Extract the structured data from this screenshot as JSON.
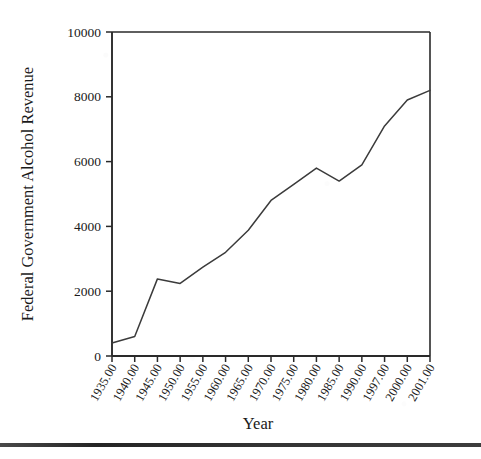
{
  "figure": {
    "background_color": "#ffffff",
    "line_color": "#3b3b3b",
    "axis_color": "#2a2a2a",
    "footer_rule": true
  },
  "chart_data": {
    "type": "line",
    "title": "",
    "xlabel": "Year",
    "ylabel": "Federal Government Alcohol Revenue",
    "xlim": [
      1935,
      2001
    ],
    "ylim": [
      0,
      10000
    ],
    "grid": false,
    "legend": "none",
    "y_ticks": [
      0,
      2000,
      4000,
      6000,
      8000,
      10000
    ],
    "y_tick_labels": [
      "0",
      "2000",
      "4000",
      "6000",
      "8000",
      "10000"
    ],
    "x_tick_labels": [
      "1935.00",
      "1940.00",
      "1945.00",
      "1950.00",
      "1955.00",
      "1960.00",
      "1965.00",
      "1970.00",
      "1975.00",
      "1980.00",
      "1985.00",
      "1990.00",
      "1997.00",
      "2000.00",
      "2001.00"
    ],
    "x": [
      1935,
      1940,
      1945,
      1950,
      1955,
      1960,
      1965,
      1970,
      1975,
      1980,
      1985,
      1990,
      1997,
      2000,
      2001
    ],
    "values": [
      400,
      600,
      2380,
      2240,
      2740,
      3200,
      3880,
      4800,
      5300,
      5800,
      5400,
      5900,
      7100,
      7900,
      8200
    ],
    "series_name": "Federal Government Alcohol Revenue"
  }
}
